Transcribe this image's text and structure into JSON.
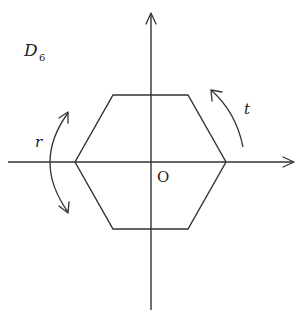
{
  "diagram": {
    "title": "D",
    "title_subscript": "6",
    "origin_label": "O",
    "rotation_label": "t",
    "reflection_label": "r",
    "shape": "regular hexagon",
    "colors": {
      "stroke": "#333333",
      "background": "#ffffff"
    }
  }
}
